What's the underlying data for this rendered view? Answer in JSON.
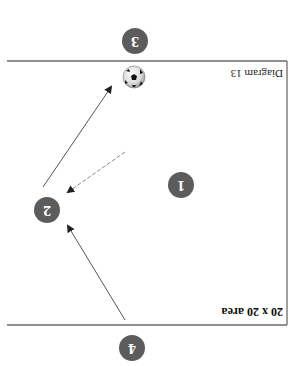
{
  "diagram": {
    "orientation": "rotated 180 degrees",
    "title": "20 x 20 area",
    "caption": "Diagram 13",
    "colors": {
      "player_fill": "#5c5c5c",
      "player_text": "#ffffff",
      "line": "#6b6b6b",
      "arrow": "#555555",
      "dashed_arrow": "#8a8a8a"
    },
    "players": [
      {
        "id": "1",
        "label": "1"
      },
      {
        "id": "2",
        "label": "2"
      },
      {
        "id": "3",
        "label": "3"
      },
      {
        "id": "4",
        "label": "4"
      }
    ],
    "ball": {
      "icon": "soccer-ball-icon"
    },
    "arrows": [
      {
        "from": "4",
        "to": "2",
        "style": "solid",
        "meaning": "run"
      },
      {
        "from": "center",
        "to": "2",
        "style": "dashed",
        "meaning": "pass"
      },
      {
        "from": "2",
        "to": "ball",
        "style": "solid",
        "meaning": "run"
      }
    ]
  }
}
